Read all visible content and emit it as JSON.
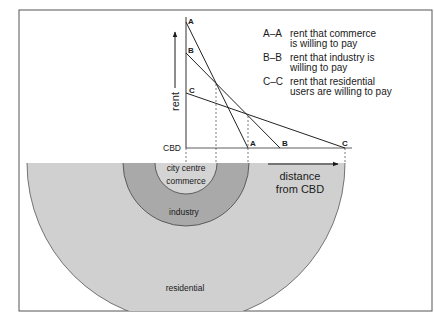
{
  "diagram": {
    "type": "bid-rent-theory",
    "colors": {
      "frame": "#555555",
      "line": "#2a2a2a",
      "residential_fill": "#d0d0d0",
      "industry_fill": "#a9a9a9",
      "commerce_fill": "#d4d4d4",
      "background": "#ffffff"
    },
    "axes": {
      "y_label": "rent",
      "origin_label": "CBD",
      "x_label_line1": "distance",
      "x_label_line2": "from CBD"
    },
    "curves": [
      {
        "id": "A",
        "start_label": "A",
        "end_label": "A",
        "legend_key": "A–A",
        "legend_line1": "rent that commerce",
        "legend_line2": "is willing to pay"
      },
      {
        "id": "B",
        "start_label": "B",
        "end_label": "B",
        "legend_key": "B–B",
        "legend_line1": "rent that industry is",
        "legend_line2": "willing to pay"
      },
      {
        "id": "C",
        "start_label": "C",
        "end_label": "C",
        "legend_key": "C–C",
        "legend_line1": "rent that residential",
        "legend_line2": "users are willing to pay"
      }
    ],
    "zones": {
      "inner_line1": "city centre",
      "inner_line2": "commerce",
      "middle": "industry",
      "outer": "residential"
    }
  }
}
